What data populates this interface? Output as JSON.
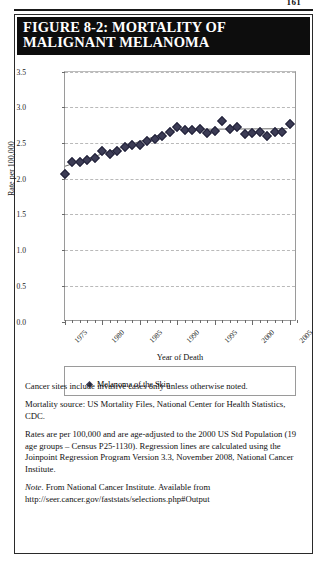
{
  "page": {
    "number": "161"
  },
  "figure": {
    "title_line1": "FIGURE 8-2: MORTALITY OF",
    "title_line2": "MALIGNANT MELANOMA"
  },
  "chart_data": {
    "type": "scatter",
    "title": "FIGURE 8-2: MORTALITY OF MALIGNANT MELANOMA",
    "xlabel": "Year of Death",
    "ylabel": "Rate per 100,000",
    "xlim": [
      1975,
      2006
    ],
    "ylim": [
      0.0,
      3.5
    ],
    "ytick_labels": [
      "0.0",
      "0.5",
      "1.0",
      "1.5",
      "2.0",
      "2.5",
      "3.0",
      "3.5"
    ],
    "ytick_values": [
      0.0,
      0.5,
      1.0,
      1.5,
      2.0,
      2.5,
      3.0,
      3.5
    ],
    "xtick_labels": [
      "1975",
      "1980",
      "1985",
      "1990",
      "1995",
      "2000",
      "2005"
    ],
    "xtick_values": [
      1975,
      1980,
      1985,
      1990,
      1995,
      2000,
      2005
    ],
    "grid": "horizontal-dashed",
    "legend_position": "below-axes",
    "series": [
      {
        "name": "Melanoma of the Skin",
        "marker": "diamond",
        "color": "#3c3c55",
        "x": [
          1975,
          1976,
          1977,
          1978,
          1979,
          1980,
          1981,
          1982,
          1983,
          1984,
          1985,
          1986,
          1987,
          1988,
          1989,
          1990,
          1991,
          1992,
          1993,
          1994,
          1995,
          1996,
          1997,
          1998,
          1999,
          2000,
          2001,
          2002,
          2003,
          2004,
          2005
        ],
        "values": [
          2.06,
          2.24,
          2.24,
          2.26,
          2.29,
          2.39,
          2.34,
          2.39,
          2.44,
          2.47,
          2.47,
          2.53,
          2.56,
          2.6,
          2.65,
          2.72,
          2.68,
          2.68,
          2.69,
          2.64,
          2.67,
          2.81,
          2.7,
          2.72,
          2.62,
          2.64,
          2.65,
          2.6,
          2.65,
          2.65,
          2.76
        ]
      }
    ],
    "regression": {
      "name": "Joinpoint regression",
      "color": "#6b6b6b",
      "joinpoints": [
        {
          "x": 1975,
          "y": 2.17
        },
        {
          "x": 1990,
          "y": 2.69
        },
        {
          "x": 2005,
          "y": 2.7
        }
      ]
    }
  },
  "legend": {
    "entry_label": "Melanoma of the Skin"
  },
  "notes": {
    "note1": "Cancer sites include invasive cases only unless otherwise noted.",
    "note2": "Mortality source: US Mortality Files, National Center for Health Statistics, CDC.",
    "note3": "Rates are per 100,000 and are age-adjusted to the 2000 US Std Population (19 age groups – Census P25-1130). Regression lines are calculated using the Joinpoint Regression Program Version 3.3, November 2008, National Cancer Institute.",
    "note4_prefix": "Note.",
    "note4_body": "From National Cancer Institute. Available from http://seer.cancer.gov/faststats/selections.php#Output"
  }
}
